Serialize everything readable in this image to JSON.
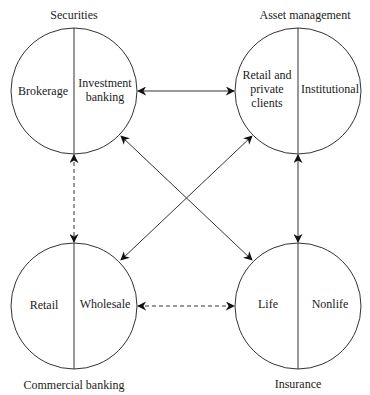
{
  "diagram": {
    "nodes": [
      {
        "id": "securities",
        "title": "Securities",
        "left": "Brokerage",
        "right": "Investment\nbanking",
        "right_lines": [
          "Investment",
          "banking"
        ]
      },
      {
        "id": "asset_management",
        "title": "Asset management",
        "left_lines": [
          "Retail and",
          "private",
          "clients"
        ],
        "right": "Institutional"
      },
      {
        "id": "commercial_banking",
        "title": "Commercial banking",
        "left": "Retail",
        "right": "Wholesale"
      },
      {
        "id": "insurance",
        "title": "Insurance",
        "left": "Life",
        "right": "Nonlife"
      }
    ],
    "edges": [
      {
        "from": "securities",
        "to": "asset_management",
        "style": "solid",
        "bidirectional": true
      },
      {
        "from": "securities",
        "to": "insurance",
        "style": "solid",
        "bidirectional": true
      },
      {
        "from": "asset_management",
        "to": "commercial_banking",
        "style": "solid",
        "bidirectional": true
      },
      {
        "from": "asset_management",
        "to": "insurance",
        "style": "solid",
        "bidirectional": true
      },
      {
        "from": "securities",
        "to": "commercial_banking",
        "style": "dashed",
        "bidirectional": true
      },
      {
        "from": "commercial_banking",
        "to": "insurance",
        "style": "dashed",
        "bidirectional": true
      }
    ],
    "colors": {
      "stroke": "#333333",
      "text": "#222222",
      "background": "#ffffff"
    }
  }
}
